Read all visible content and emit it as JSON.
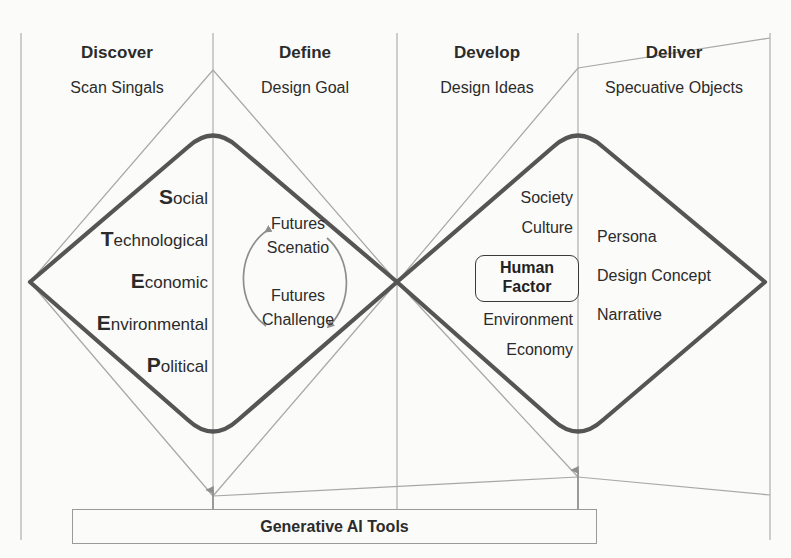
{
  "diagram": {
    "colors": {
      "diamond_stroke": "#555555",
      "guide_stroke": "#a8a8a8",
      "divider_stroke": "#b4b4b4",
      "text": "#2b2b2b",
      "background": "#fbfbfa"
    }
  },
  "phases": [
    {
      "title": "Discover",
      "subtitle": "Scan Singals"
    },
    {
      "title": "Define",
      "subtitle": "Design Goal"
    },
    {
      "title": "Develop",
      "subtitle": "Design Ideas"
    },
    {
      "title": "Deliver",
      "subtitle": "Specuative Objects"
    }
  ],
  "discover": {
    "items": [
      {
        "initial": "S",
        "rest": "ocial"
      },
      {
        "initial": "T",
        "rest": "echnological"
      },
      {
        "initial": "E",
        "rest": "conomic"
      },
      {
        "initial": "E",
        "rest": "nvironmental"
      },
      {
        "initial": "P",
        "rest": "olitical"
      }
    ]
  },
  "define": {
    "loop": [
      {
        "line1": "Futures",
        "line2": "Scenatio"
      },
      {
        "line1": "Futures",
        "line2": "Challenge"
      }
    ]
  },
  "develop": {
    "items_above": [
      "Society",
      "Culture"
    ],
    "highlight": {
      "line1": "Human",
      "line2": "Factor"
    },
    "items_below": [
      "Environment",
      "Economy"
    ]
  },
  "deliver": {
    "items": [
      "Persona",
      "Design Concept",
      "Narrative"
    ]
  },
  "footer": {
    "label": "Generative AI Tools"
  }
}
